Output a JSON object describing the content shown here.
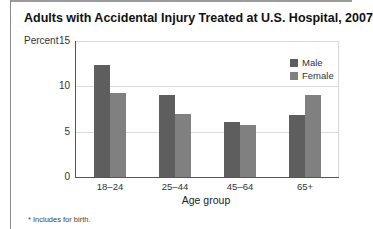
{
  "title": "Adults with Accidental Injury Treated at U.S. Hospital, 2007",
  "footnote": "* Includes for birth.",
  "colors": {
    "male": "#5e5e5e",
    "female": "#808080"
  },
  "chart_data": {
    "type": "bar",
    "title": "Adults with Accidental Injury Treated at U.S. Hospital, 2007",
    "xlabel": "Age group",
    "ylabel": "Percent",
    "ylim": [
      0,
      15
    ],
    "yticks": [
      "0",
      "5",
      "10",
      "15"
    ],
    "grid": true,
    "legend_position": "top-right",
    "categories": [
      "18–24",
      "25–44",
      "45–64",
      "65+"
    ],
    "series": [
      {
        "name": "Male",
        "values": [
          12.4,
          9.0,
          6.1,
          6.8
        ]
      },
      {
        "name": "Female",
        "values": [
          9.3,
          7.0,
          5.7,
          9.0
        ]
      }
    ],
    "footnote": "* Includes for birth."
  }
}
